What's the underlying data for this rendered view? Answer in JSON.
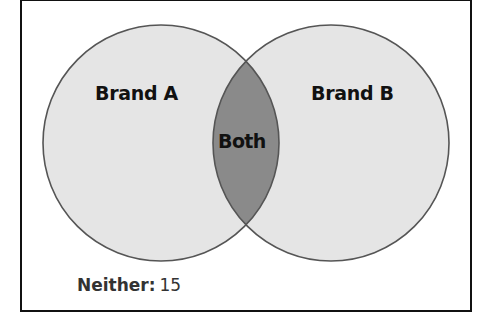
{
  "diagram": {
    "type": "venn",
    "sets": [
      {
        "id": "A",
        "label": "Brand A"
      },
      {
        "id": "B",
        "label": "Brand B"
      }
    ],
    "intersection": {
      "label": "Both"
    },
    "outside": {
      "label": "Neither:",
      "value": "15"
    }
  },
  "colors": {
    "circle_fill": "#e5e5e5",
    "intersection_fill": "#8a8a8a",
    "circle_stroke": "#555555",
    "frame_border": "#111111",
    "text": "#111111",
    "neither_text": "#333333"
  }
}
